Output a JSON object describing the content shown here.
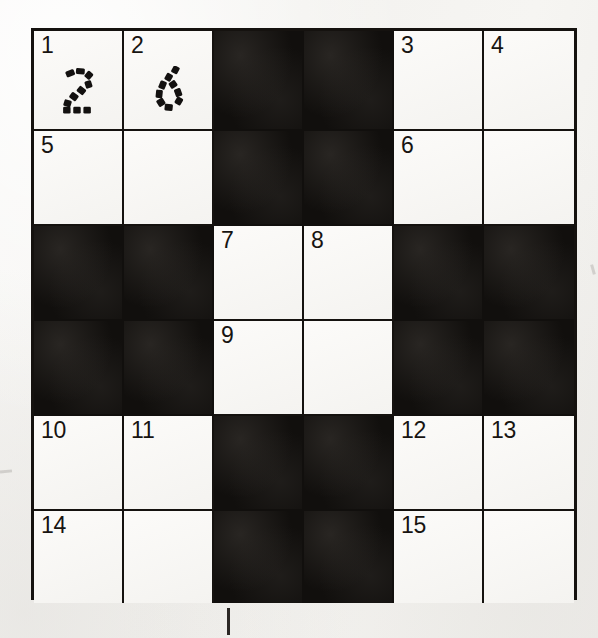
{
  "page": {
    "kind": "crossword-grid",
    "background_color": "#f6f5f3",
    "ink_color": "#15120f",
    "white_cell_color": "#faf9f7",
    "black_cell_color": "#110f0d",
    "size": {
      "columns": 6,
      "rows": 6
    }
  },
  "grid": {
    "rows": [
      [
        {
          "type": "white",
          "number": "1",
          "answer": "2",
          "answer_style": "dotted"
        },
        {
          "type": "white",
          "number": "2",
          "answer": "6",
          "answer_style": "dotted"
        },
        {
          "type": "black",
          "number": "",
          "answer": "",
          "answer_style": ""
        },
        {
          "type": "black",
          "number": "",
          "answer": "",
          "answer_style": ""
        },
        {
          "type": "white",
          "number": "3",
          "answer": "",
          "answer_style": ""
        },
        {
          "type": "white",
          "number": "4",
          "answer": "",
          "answer_style": ""
        }
      ],
      [
        {
          "type": "white",
          "number": "5",
          "answer": "",
          "answer_style": ""
        },
        {
          "type": "white",
          "number": "",
          "answer": "",
          "answer_style": ""
        },
        {
          "type": "black",
          "number": "",
          "answer": "",
          "answer_style": ""
        },
        {
          "type": "black",
          "number": "",
          "answer": "",
          "answer_style": ""
        },
        {
          "type": "white",
          "number": "6",
          "answer": "",
          "answer_style": ""
        },
        {
          "type": "white",
          "number": "",
          "answer": "",
          "answer_style": ""
        }
      ],
      [
        {
          "type": "black",
          "number": "",
          "answer": "",
          "answer_style": ""
        },
        {
          "type": "black",
          "number": "",
          "answer": "",
          "answer_style": ""
        },
        {
          "type": "white",
          "number": "7",
          "answer": "",
          "answer_style": ""
        },
        {
          "type": "white",
          "number": "8",
          "answer": "",
          "answer_style": ""
        },
        {
          "type": "black",
          "number": "",
          "answer": "",
          "answer_style": ""
        },
        {
          "type": "black",
          "number": "",
          "answer": "",
          "answer_style": ""
        }
      ],
      [
        {
          "type": "black",
          "number": "",
          "answer": "",
          "answer_style": ""
        },
        {
          "type": "black",
          "number": "",
          "answer": "",
          "answer_style": ""
        },
        {
          "type": "white",
          "number": "9",
          "answer": "",
          "answer_style": ""
        },
        {
          "type": "white",
          "number": "",
          "answer": "",
          "answer_style": ""
        },
        {
          "type": "black",
          "number": "",
          "answer": "",
          "answer_style": ""
        },
        {
          "type": "black",
          "number": "",
          "answer": "",
          "answer_style": ""
        }
      ],
      [
        {
          "type": "white",
          "number": "10",
          "answer": "",
          "answer_style": ""
        },
        {
          "type": "white",
          "number": "11",
          "answer": "",
          "answer_style": ""
        },
        {
          "type": "black",
          "number": "",
          "answer": "",
          "answer_style": ""
        },
        {
          "type": "black",
          "number": "",
          "answer": "",
          "answer_style": ""
        },
        {
          "type": "white",
          "number": "12",
          "answer": "",
          "answer_style": ""
        },
        {
          "type": "white",
          "number": "13",
          "answer": "",
          "answer_style": ""
        }
      ],
      [
        {
          "type": "white",
          "number": "14",
          "answer": "",
          "answer_style": ""
        },
        {
          "type": "white",
          "number": "",
          "answer": "",
          "answer_style": ""
        },
        {
          "type": "black",
          "number": "",
          "answer": "",
          "answer_style": ""
        },
        {
          "type": "black",
          "number": "",
          "answer": "",
          "answer_style": ""
        },
        {
          "type": "white",
          "number": "15",
          "answer": "",
          "answer_style": ""
        },
        {
          "type": "white",
          "number": "",
          "answer": "",
          "answer_style": ""
        }
      ]
    ]
  },
  "marks": {
    "registration_tick": "registration-tick"
  }
}
